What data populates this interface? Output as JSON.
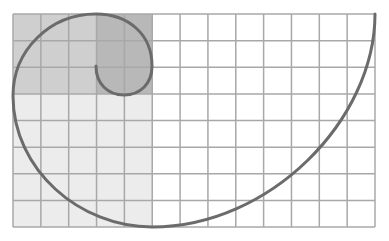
{
  "diagram": {
    "type": "golden-spiral-on-grid",
    "grid": {
      "left": 13,
      "top": 14,
      "right": 375,
      "bottom": 227,
      "columns": 13,
      "rows": 8,
      "line_color": "#a8a8a8"
    },
    "regions": [
      {
        "name": "large-light-region",
        "col": 0,
        "row": 3,
        "cols": 5,
        "rows": 5,
        "color": "#ececec"
      },
      {
        "name": "medium-region",
        "col": 0,
        "row": 0,
        "cols": 3,
        "rows": 3,
        "color": "#cfcfcf"
      },
      {
        "name": "small-dark-region",
        "col": 3,
        "row": 0,
        "cols": 2,
        "rows": 3,
        "color": "#b8b8b8"
      }
    ],
    "spiral": {
      "color": "#6b6b6b",
      "width": 3
    }
  }
}
